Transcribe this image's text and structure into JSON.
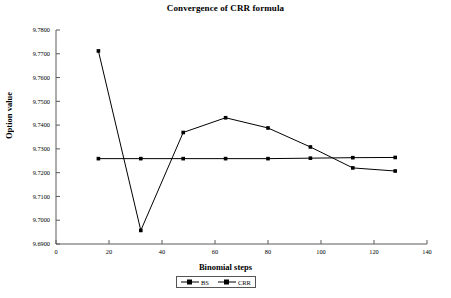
{
  "chart_data": {
    "type": "line",
    "title": "Convergence of CRR formula",
    "xlabel": "Binomial steps",
    "ylabel": "Option value",
    "xlim": [
      0,
      140
    ],
    "ylim": [
      9.69,
      9.78
    ],
    "xticks": [
      0,
      20,
      40,
      60,
      80,
      100,
      120,
      140
    ],
    "xtick_labels": [
      "0",
      "20",
      "40",
      "60",
      "80",
      "100",
      "120",
      "140"
    ],
    "yticks": [
      9.69,
      9.7,
      9.71,
      9.72,
      9.73,
      9.74,
      9.75,
      9.76,
      9.77,
      9.78
    ],
    "ytick_labels": [
      "9.6900",
      "9.7000",
      "9.7100",
      "9.7200",
      "9.7300",
      "9.7400",
      "9.7500",
      "9.7600",
      "9.7700",
      "9.7800"
    ],
    "grid": false,
    "legend_position": "bottom-center",
    "x": [
      16,
      32,
      48,
      64,
      80,
      96,
      112,
      128
    ],
    "series": [
      {
        "name": "BS",
        "values": [
          9.7259,
          9.7259,
          9.7259,
          9.7259,
          9.7259,
          9.7261,
          9.7263,
          9.7264
        ],
        "color": "#000000",
        "marker": "square"
      },
      {
        "name": "CRR",
        "values": [
          9.7712,
          9.6957,
          9.7369,
          9.7431,
          9.7388,
          9.7308,
          9.722,
          9.7207
        ],
        "color": "#000000",
        "marker": "square"
      }
    ]
  },
  "legend": {
    "entries": [
      {
        "label": "BS"
      },
      {
        "label": "CRR"
      }
    ]
  }
}
